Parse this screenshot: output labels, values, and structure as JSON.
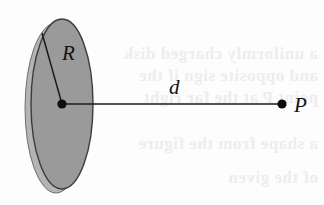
{
  "figure": {
    "canvas": {
      "width": 324,
      "height": 205,
      "background": "#fdfdfd"
    },
    "labels": {
      "radius": "R",
      "distance": "d",
      "point": "P"
    },
    "colors": {
      "disk_face": "#9a9a9a",
      "disk_rim": "#b4b4b4",
      "disk_outline": "#3c3c3c",
      "line": "#1a1a1a",
      "dot": "#0d0d0d",
      "text": "#141414",
      "bleed_text": "#ededed",
      "background": "#fdfdfd"
    },
    "geometry": {
      "disk_center_x": 62,
      "disk_center_y": 104,
      "disk_radius_x": 31,
      "disk_radius_y": 85,
      "rim_offset_x": -6,
      "rim_offset_y": 4,
      "radius_line_end_x": 42,
      "radius_line_end_y": 33,
      "axis_line_end_x": 282,
      "axis_line_end_y": 104,
      "dot_radius": 4.6
    }
  },
  "background_bleed": {
    "note": "faint mirrored show-through text from reverse of printed page",
    "lines": [
      {
        "text": "a uniformly charged disk",
        "x": 318,
        "y": 44,
        "size": 17
      },
      {
        "text": "and opposite sign if the",
        "x": 318,
        "y": 66,
        "size": 17
      },
      {
        "text": "point P at the far right",
        "x": 318,
        "y": 88,
        "size": 17
      },
      {
        "text": "a shape from the figure",
        "x": 318,
        "y": 134,
        "size": 17
      },
      {
        "text": "of the given",
        "x": 318,
        "y": 168,
        "size": 17
      }
    ]
  }
}
